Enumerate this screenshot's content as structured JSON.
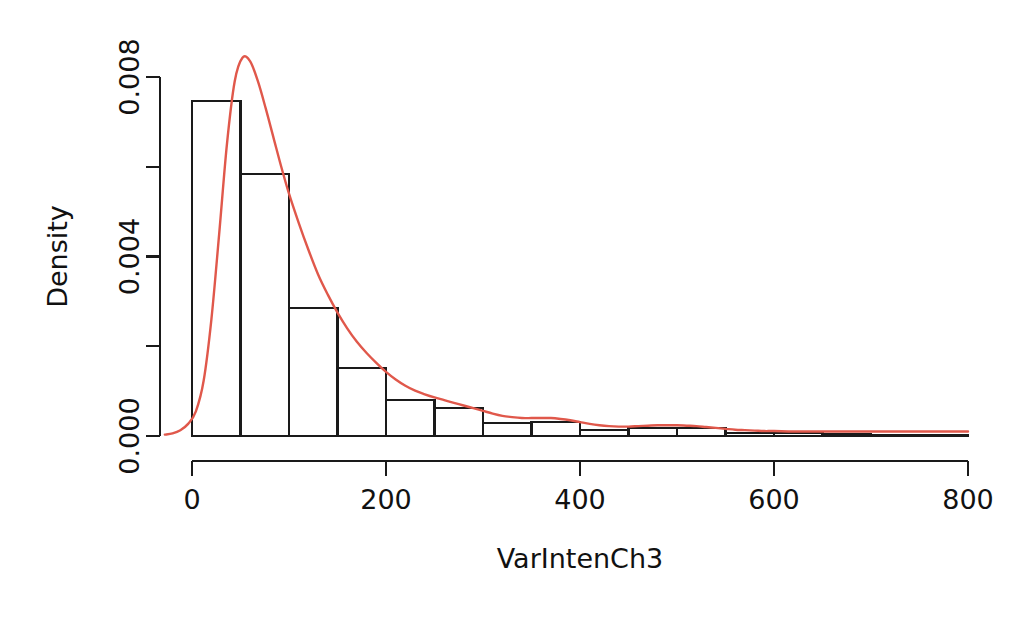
{
  "chart_data": {
    "type": "histogram",
    "title": "",
    "xlabel": "VarIntenCh3",
    "ylabel": "Density",
    "xlim": [
      -30,
      810
    ],
    "ylim": [
      0,
      0.0085
    ],
    "xticks": [
      0,
      200,
      400,
      600,
      800
    ],
    "xtick_labels": [
      "0",
      "200",
      "400",
      "600",
      "800"
    ],
    "yticks": [
      0.0,
      0.002,
      0.004,
      0.006,
      0.008
    ],
    "ytick_labels": [
      "0.000",
      "",
      "0.004",
      "",
      "0.008"
    ],
    "ytick_labels_shown": [
      "0.000",
      "0.004",
      "0.008"
    ],
    "grid": false,
    "legend": "none",
    "bin_width": 50,
    "bin_edges": [
      0,
      50,
      100,
      150,
      200,
      250,
      300,
      350,
      400,
      450,
      500,
      550,
      600,
      650,
      700,
      750,
      800
    ],
    "bars": [
      {
        "x0": 0,
        "x1": 50,
        "density": 0.00747
      },
      {
        "x0": 50,
        "x1": 100,
        "density": 0.00584
      },
      {
        "x0": 100,
        "x1": 150,
        "density": 0.00285
      },
      {
        "x0": 150,
        "x1": 200,
        "density": 0.00152
      },
      {
        "x0": 200,
        "x1": 250,
        "density": 0.0008
      },
      {
        "x0": 250,
        "x1": 300,
        "density": 0.00062
      },
      {
        "x0": 300,
        "x1": 350,
        "density": 0.00029
      },
      {
        "x0": 350,
        "x1": 400,
        "density": 0.00031
      },
      {
        "x0": 400,
        "x1": 450,
        "density": 0.00013
      },
      {
        "x0": 450,
        "x1": 500,
        "density": 0.00018
      },
      {
        "x0": 500,
        "x1": 550,
        "density": 0.00018
      },
      {
        "x0": 550,
        "x1": 600,
        "density": 7e-05
      },
      {
        "x0": 600,
        "x1": 650,
        "density": 7e-05
      },
      {
        "x0": 650,
        "x1": 700,
        "density": 4e-05
      },
      {
        "x0": 700,
        "x1": 750,
        "density": 2e-05
      },
      {
        "x0": 750,
        "x1": 800,
        "density": 2e-05
      }
    ],
    "density_curve": {
      "name": "kernel-density-estimate",
      "color": "#E0584B",
      "x": [
        -28,
        -20,
        -12,
        -4,
        4,
        12,
        20,
        28,
        36,
        44,
        52,
        60,
        68,
        76,
        84,
        92,
        100,
        110,
        120,
        130,
        140,
        150,
        160,
        170,
        180,
        190,
        200,
        210,
        220,
        230,
        240,
        250,
        260,
        270,
        280,
        290,
        300,
        310,
        320,
        330,
        340,
        350,
        360,
        370,
        380,
        390,
        400,
        410,
        420,
        430,
        440,
        450,
        460,
        470,
        480,
        490,
        500,
        510,
        520,
        530,
        540,
        550,
        560,
        570,
        580,
        590,
        600,
        620,
        640,
        660,
        680,
        700,
        720,
        740,
        760,
        780,
        800
      ],
      "y": [
        3e-05,
        6e-05,
        0.00013,
        0.00027,
        0.00055,
        0.00123,
        0.0026,
        0.0045,
        0.0065,
        0.0079,
        0.00843,
        0.00835,
        0.0079,
        0.0073,
        0.00665,
        0.006,
        0.0054,
        0.00475,
        0.00415,
        0.0036,
        0.00315,
        0.00275,
        0.0024,
        0.0021,
        0.00185,
        0.00163,
        0.00143,
        0.00126,
        0.00112,
        0.00101,
        0.00093,
        0.00086,
        0.0008,
        0.00074,
        0.00068,
        0.00062,
        0.00056,
        0.0005,
        0.00045,
        0.00042,
        0.0004,
        0.0004,
        0.0004,
        0.0004,
        0.00038,
        0.00035,
        0.00031,
        0.00027,
        0.00024,
        0.00022,
        0.00021,
        0.00021,
        0.00022,
        0.00023,
        0.00024,
        0.00024,
        0.00024,
        0.00023,
        0.00022,
        0.0002,
        0.00018,
        0.00016,
        0.00014,
        0.00013,
        0.00012,
        0.00011,
        0.00011,
        0.0001,
        0.0001,
        0.0001,
        0.0001,
        0.0001,
        0.0001,
        0.0001,
        0.0001,
        0.0001,
        0.0001
      ]
    },
    "style": {
      "bar_edge_color": "#1a1a1a",
      "bar_fill_color": "#ffffff",
      "axis_color": "#1a1a1a",
      "text_color": "#111111"
    }
  }
}
